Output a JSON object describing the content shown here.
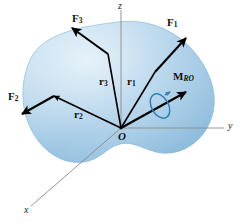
{
  "figure": {
    "body_shape_name": "rigid-body-blob",
    "colors": {
      "body_fill_light": "#d5e7f4",
      "body_fill_mid": "#a9cde6",
      "body_fill_dark": "#8cbcdc",
      "body_edge": "#7fb4d6",
      "vector_stroke": "#000000",
      "axis_stroke": "#8a8a8a",
      "moment_curl": "#2f7fb5",
      "background": "#ffffff"
    },
    "axes": [
      {
        "name": "z-axis",
        "label": "z",
        "direction": "up"
      },
      {
        "name": "y-axis",
        "label": "y",
        "direction": "right"
      },
      {
        "name": "x-axis",
        "label": "x",
        "direction": "lower-left"
      }
    ],
    "origin": {
      "label": "O",
      "name": "origin-point"
    },
    "force_vectors": [
      {
        "name": "force-vector-1",
        "label": "F",
        "subscript": "1",
        "direction": "upper-right"
      },
      {
        "name": "force-vector-2",
        "label": "F",
        "subscript": "2",
        "direction": "lower-left"
      },
      {
        "name": "force-vector-3",
        "label": "F",
        "subscript": "3",
        "direction": "upper-left"
      }
    ],
    "position_vectors": [
      {
        "name": "position-vector-1",
        "label": "r",
        "subscript": "1",
        "from": "O",
        "to": "F1 application point"
      },
      {
        "name": "position-vector-2",
        "label": "r",
        "subscript": "2",
        "from": "O",
        "to": "F2 application point"
      },
      {
        "name": "position-vector-3",
        "label": "r",
        "subscript": "3",
        "from": "O",
        "to": "F3 application point"
      }
    ],
    "moment_vector": {
      "name": "resultant-moment-vector",
      "label": "M",
      "subscript": "R",
      "sub_subscript": "O",
      "subscript_full": "R O",
      "direction": "upper-right",
      "curl_name": "moment-curl-arrow"
    }
  }
}
